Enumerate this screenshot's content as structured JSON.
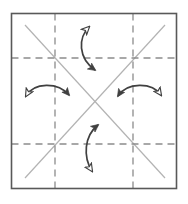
{
  "figure": {
    "caption": "",
    "background_color": "#ffffff"
  },
  "chart_data": {
    "type": "diagram",
    "xlabel": "",
    "ylabel": "",
    "xlim": [
      0,
      188
    ],
    "ylim": [
      0,
      204
    ],
    "grid": true,
    "legend": "none",
    "colors": {
      "frame_stroke": "#595959",
      "dashed_grid_stroke": "#8c8c8c",
      "diagonal_stroke": "#b3b3b3",
      "arrow_stroke": "#404040",
      "arrow_fill_solid": "#404040",
      "arrow_fill_hollow": "#ffffff",
      "background": "#ffffff"
    },
    "frame": {
      "name": "outer-square",
      "x": 11.5,
      "y": 13.5,
      "width": 165,
      "height": 175,
      "stroke_width": 1.6,
      "fill": "none"
    },
    "dashed_lines": [
      {
        "name": "vertical-mirror-left",
        "orientation": "vertical",
        "x1": 55,
        "y1": 13.5,
        "x2": 55,
        "y2": 188.5
      },
      {
        "name": "vertical-mirror-right",
        "orientation": "vertical",
        "x1": 133,
        "y1": 13.5,
        "x2": 133,
        "y2": 188.5
      },
      {
        "name": "horizontal-mirror-top",
        "orientation": "horizontal",
        "x1": 11.5,
        "y1": 58,
        "x2": 176.5,
        "y2": 58
      },
      {
        "name": "horizontal-mirror-bottom",
        "orientation": "horizontal",
        "x1": 11.5,
        "y1": 144,
        "x2": 176.5,
        "y2": 144
      }
    ],
    "dash_pattern": "7,5",
    "dashed_stroke_width": 1.3,
    "diagonals": [
      {
        "name": "diagonal-nw-se",
        "x1": 25,
        "y1": 25,
        "x2": 165,
        "y2": 178
      },
      {
        "name": "diagonal-sw-ne",
        "x1": 25,
        "y1": 178,
        "x2": 165,
        "y2": 25
      }
    ],
    "diagonal_stroke_width": 1.2,
    "arrows": [
      {
        "name": "arrow-top",
        "position": "top",
        "double_headed": true,
        "path": "M 95 70 C 78 58, 78 38, 89 27",
        "head_start": {
          "type": "filled",
          "at": "bottom-end"
        },
        "head_end": {
          "type": "hollow",
          "at": "top-end"
        },
        "meaning": "two-fold rotation indicator"
      },
      {
        "name": "arrow-left",
        "position": "left",
        "double_headed": true,
        "path": "M 26 96 C 34 82, 58 82, 69 95",
        "head_start": {
          "type": "hollow",
          "at": "left-end"
        },
        "head_end": {
          "type": "filled",
          "at": "right-end"
        },
        "meaning": "two-fold rotation indicator"
      },
      {
        "name": "arrow-right",
        "position": "right",
        "double_headed": true,
        "path": "M 118 96 C 127 82, 152 82, 161 95",
        "head_start": {
          "type": "filled",
          "at": "left-end"
        },
        "head_end": {
          "type": "hollow",
          "at": "right-end"
        },
        "meaning": "two-fold rotation indicator"
      },
      {
        "name": "arrow-bottom",
        "position": "bottom",
        "double_headed": true,
        "path": "M 98 125 C 84 136, 83 157, 92 171",
        "head_start": {
          "type": "filled",
          "at": "top-end"
        },
        "head_end": {
          "type": "hollow",
          "at": "bottom-end"
        },
        "meaning": "two-fold rotation indicator"
      }
    ],
    "annotations": [],
    "tick_labels": [],
    "legend_entries": []
  }
}
